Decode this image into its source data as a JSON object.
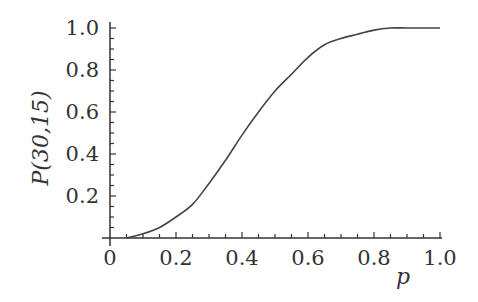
{
  "chart_data": {
    "type": "line",
    "title": "",
    "xlabel": "p",
    "ylabel": "P(30,15)",
    "xlim": [
      0,
      1.0
    ],
    "ylim": [
      0,
      1.0
    ],
    "grid": false,
    "legend": null,
    "x_ticks": [
      "0",
      "0.2",
      "0.4",
      "0.6",
      "0.8",
      "1.0"
    ],
    "y_ticks": [
      "0.2",
      "0.4",
      "0.6",
      "0.8",
      "1.0"
    ],
    "series": [
      {
        "name": "P(30,15)",
        "color": "#444444",
        "x": [
          0.05,
          0.1,
          0.15,
          0.2,
          0.25,
          0.3,
          0.35,
          0.4,
          0.45,
          0.5,
          0.55,
          0.6,
          0.65,
          0.7,
          0.75,
          0.8,
          0.85,
          0.9,
          0.95,
          1.0
        ],
        "y": [
          0.0,
          0.02,
          0.05,
          0.1,
          0.16,
          0.26,
          0.37,
          0.49,
          0.6,
          0.7,
          0.78,
          0.86,
          0.92,
          0.95,
          0.97,
          0.99,
          1.0,
          1.0,
          1.0,
          1.0
        ]
      }
    ]
  }
}
